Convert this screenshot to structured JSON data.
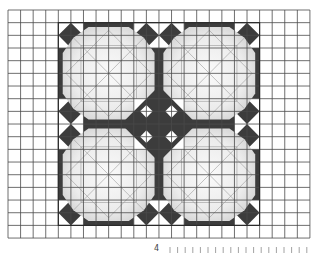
{
  "figure": {
    "grid": {
      "origin_x": 8,
      "origin_y": 10,
      "cols": 24,
      "rows": 18,
      "cell_w": 12.58,
      "cell_h": 12.67,
      "line_color": "#4a4a4a"
    },
    "pattern": {
      "col_start": 4,
      "row_start": 1,
      "quadrant_cells": 8,
      "quadrants": 4,
      "colors": {
        "dark": "#3c3c3c",
        "octagon": "#e4e4e4",
        "octagon_center": "#f7f7f7",
        "construction_line": "#9a9a9a",
        "corner_light": "#ffffff"
      }
    }
  },
  "footer": {
    "page_label": "4",
    "tick_count": 19,
    "tick_start_x": 170,
    "tick_spacing": 7.6
  }
}
